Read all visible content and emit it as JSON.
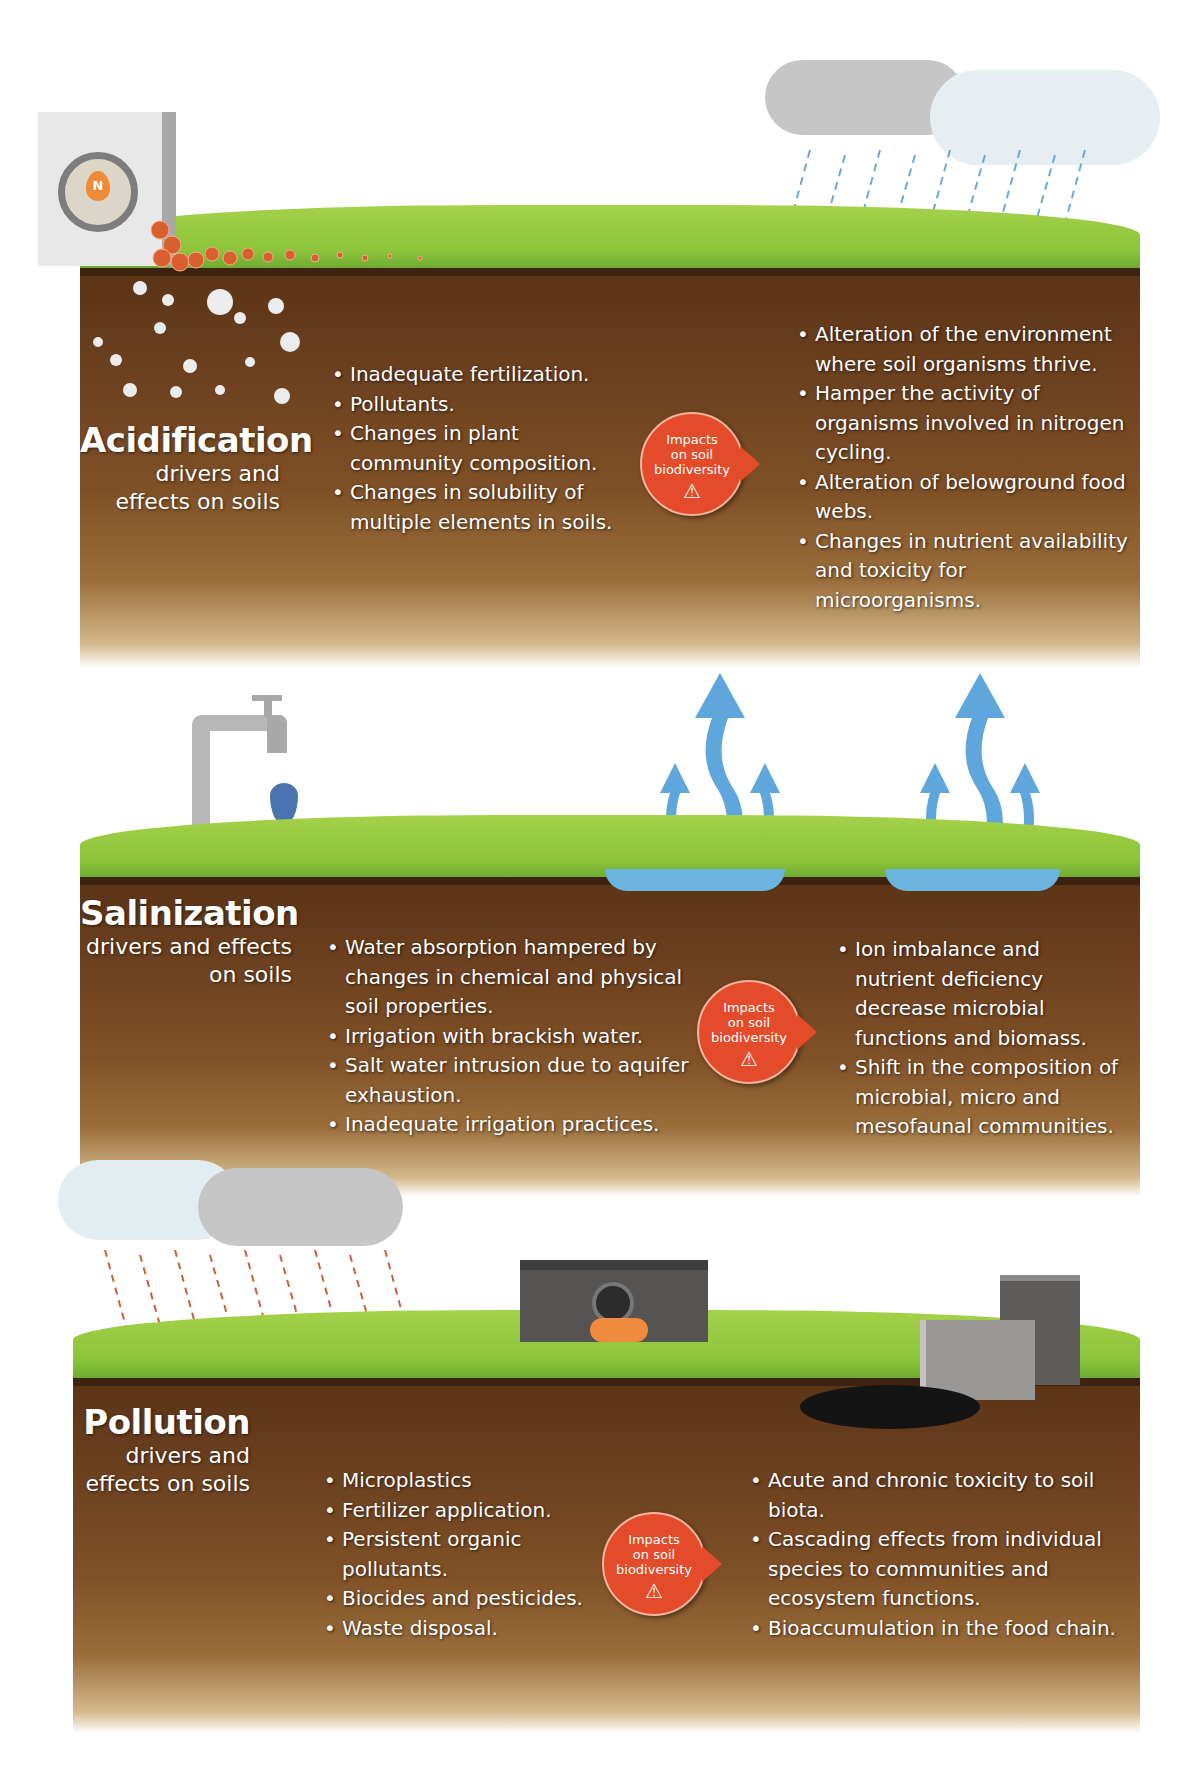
{
  "colors": {
    "grass": "#8cc43a",
    "soil_dark": "#5a3416",
    "soil_light": "#9a6d3a",
    "impact_badge": "#e34b2a",
    "water_arrow": "#5fa6dc",
    "cloud": "#c8c8c8",
    "fertilizer_pellet": "#d9602e"
  },
  "impact_badge": {
    "line1": "Impacts",
    "line2": "on soil",
    "line3": "biodiversity",
    "icon": "warning-triangle-icon"
  },
  "panels": [
    {
      "id": "acidification",
      "title": "Acidification",
      "subtitle_line1": "drivers and",
      "subtitle_line2": "effects on soils",
      "illustrations": [
        "fertilizer-bag-icon",
        "fertilizer-pellets",
        "rain-cloud-icon",
        "white-particles"
      ],
      "bag_label": "N",
      "drivers": [
        "Inadequate fertilization.",
        "Pollutants.",
        "Changes in plant community composition.",
        "Changes in solubility of multiple elements in soils."
      ],
      "effects": [
        "Alteration of the environment where soil organisms thrive.",
        "Hamper the activity of organisms involved in nitrogen cycling.",
        "Alteration of belowground food webs.",
        "Changes in nutrient availability and toxicity for microorganisms."
      ]
    },
    {
      "id": "salinization",
      "title": "Salinization",
      "subtitle_line1": "drivers and effects",
      "subtitle_line2": "on soils",
      "illustrations": [
        "water-tap-icon",
        "salt-water-drop-icon",
        "evaporation-arrows-icon",
        "salt-puddle"
      ],
      "drivers": [
        "Water absorption hampered by changes in chemical and physical soil properties.",
        "Irrigation with brackish water.",
        "Salt water intrusion due to aquifer exhaustion.",
        "Inadequate irrigation practices."
      ],
      "effects": [
        "Ion imbalance and nutrient deficiency decrease microbial functions and biomass.",
        "Shift in the composition of microbial, micro and mesofaunal communities."
      ]
    },
    {
      "id": "pollution",
      "title": "Pollution",
      "subtitle_line1": "drivers and",
      "subtitle_line2": "effects on soils",
      "illustrations": [
        "acid-rain-cloud-icon",
        "waste-pipe-icon",
        "toxic-barrels-icon",
        "oil-spill"
      ],
      "drivers": [
        "Microplastics",
        "Fertilizer application.",
        "Persistent organic pollutants.",
        "Biocides and pesticides.",
        "Waste disposal."
      ],
      "effects": [
        "Acute and chronic toxicity to soil biota.",
        "Cascading effects from individual species to communities and ecosystem functions.",
        "Bioaccumulation in the food chain."
      ]
    }
  ]
}
